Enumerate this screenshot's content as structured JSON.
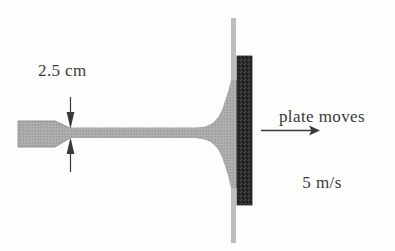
{
  "figure": {
    "background_color": "#fdfdfb",
    "labels": {
      "jet_diameter": "2.5 cm",
      "plate_motion_line1": "plate moves",
      "plate_motion_line2": "5 m/s"
    },
    "values": {
      "jet_diameter_value": 2.5,
      "jet_diameter_unit": "cm",
      "plate_speed_value": 5,
      "plate_speed_unit": "m/s"
    },
    "colors": {
      "fluid_gray": "#a8a8a8",
      "nozzle_gray": "#a8a8a8",
      "plate_dark": "#2b2b2b",
      "support_line": "#b9b9b9",
      "ink": "#3a3a3a"
    },
    "parts": {
      "nozzle": "nozzle-body",
      "jet": "water-jet-stream",
      "flare": "jet-deflection-spray",
      "plate": "flat-plate",
      "support": "plate-support-line",
      "dimension": "jet-diameter-dimension",
      "velocity_arrow": "plate-velocity-arrow"
    }
  }
}
